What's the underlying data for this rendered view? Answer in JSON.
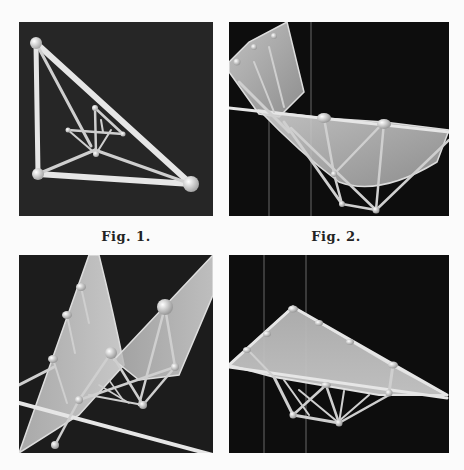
{
  "figures": [
    {
      "id": "fig1",
      "caption": "Fig. 1.",
      "description": "tetrahedral wireframe with nested smaller framework"
    },
    {
      "id": "fig2",
      "caption": "Fig. 2.",
      "description": "translucent curved surface supported by rod framework"
    },
    {
      "id": "fig3",
      "caption": "",
      "description": "twisted translucent surface with rod framework and spheres"
    },
    {
      "id": "fig4",
      "caption": "",
      "description": "triangular translucent surface with truss framework beneath"
    }
  ],
  "colors": {
    "page_background": "#fbfbfb",
    "panel_background": "#141414",
    "rod": "#e6e6e6",
    "surface": "#bdbdbd",
    "caption_text": "#222222"
  }
}
